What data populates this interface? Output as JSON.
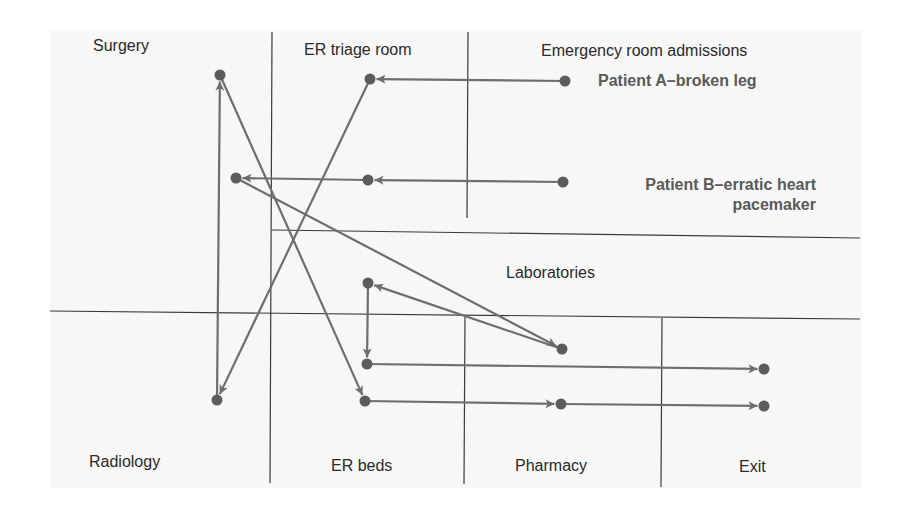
{
  "diagram": {
    "colors": {
      "background": "#ffffff",
      "paper": "#f7f7f7",
      "grid_line": "#3a3a3a",
      "flow_line": "#6e6e6e",
      "node": "#5c5c5c",
      "label_text": "#2a2a2a",
      "patient_text": "#5a5a5a"
    },
    "areas": {
      "surgery": "Surgery",
      "er_triage": "ER triage room",
      "admissions": "Emergency room admissions",
      "laboratories": "Laboratories",
      "radiology": "Radiology",
      "er_beds": "ER beds",
      "pharmacy": "Pharmacy",
      "exit": "Exit"
    },
    "patients": {
      "a": "Patient A–broken leg",
      "b_line1": "Patient B–erratic heart",
      "b_line2": "pacemaker"
    },
    "grid_lines": [
      {
        "x1": 272,
        "y1": 32,
        "x2": 270,
        "y2": 483
      },
      {
        "x1": 468,
        "y1": 32,
        "x2": 467,
        "y2": 218
      },
      {
        "x1": 272,
        "y1": 230,
        "x2": 860,
        "y2": 238
      },
      {
        "x1": 50,
        "y1": 311,
        "x2": 860,
        "y2": 319
      },
      {
        "x1": 465,
        "y1": 316,
        "x2": 464,
        "y2": 484
      },
      {
        "x1": 662,
        "y1": 318,
        "x2": 661,
        "y2": 487
      }
    ],
    "nodes": [
      {
        "id": "surgery_a",
        "x": 220,
        "y": 75
      },
      {
        "id": "surgery_b",
        "x": 236,
        "y": 178
      },
      {
        "id": "triage_a",
        "x": 370,
        "y": 79
      },
      {
        "id": "triage_b",
        "x": 368,
        "y": 180
      },
      {
        "id": "admit_a",
        "x": 565,
        "y": 81
      },
      {
        "id": "admit_b",
        "x": 563,
        "y": 182
      },
      {
        "id": "radiology_a",
        "x": 217,
        "y": 400
      },
      {
        "id": "beds_b1",
        "x": 368,
        "y": 283
      },
      {
        "id": "beds_b2",
        "x": 367,
        "y": 364
      },
      {
        "id": "beds_a",
        "x": 365,
        "y": 401
      },
      {
        "id": "labs_b",
        "x": 562,
        "y": 349
      },
      {
        "id": "pharmacy_a",
        "x": 561,
        "y": 404
      },
      {
        "id": "exit_b",
        "x": 764,
        "y": 369
      },
      {
        "id": "exit_a",
        "x": 764,
        "y": 406
      }
    ],
    "flows": [
      {
        "patient": "A",
        "from": "admit_a",
        "to": "triage_a"
      },
      {
        "patient": "A",
        "from": "triage_a",
        "to": "radiology_a"
      },
      {
        "patient": "A",
        "from": "radiology_a",
        "to": "surgery_a"
      },
      {
        "patient": "A",
        "from": "surgery_a",
        "to": "beds_a"
      },
      {
        "patient": "A",
        "from": "beds_a",
        "to": "pharmacy_a"
      },
      {
        "patient": "A",
        "from": "pharmacy_a",
        "to": "exit_a"
      },
      {
        "patient": "B",
        "from": "admit_b",
        "to": "triage_b"
      },
      {
        "patient": "B",
        "from": "triage_b",
        "to": "surgery_b"
      },
      {
        "patient": "B",
        "from": "surgery_b",
        "to": "labs_b"
      },
      {
        "patient": "B",
        "from": "labs_b",
        "to": "beds_b1"
      },
      {
        "patient": "B",
        "from": "beds_b1",
        "to": "beds_b2"
      },
      {
        "patient": "B",
        "from": "beds_b2",
        "to": "exit_b"
      }
    ]
  }
}
